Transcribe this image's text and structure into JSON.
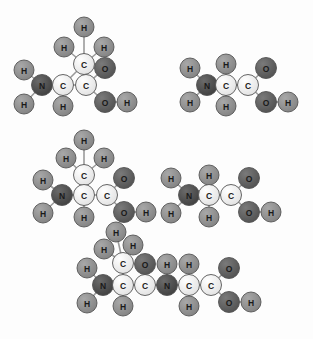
{
  "figure": {
    "width": 313,
    "height": 339,
    "background_color": "#fdfdfd"
  },
  "element_colors": {
    "C": "#ededed",
    "N": "#4d4d4d",
    "O": "#5e5e5e",
    "H": "#8f8f8f",
    "outline": "#555555",
    "bond": "#9a9a9a"
  },
  "legend_elements": [
    {
      "symbol": "C",
      "name": "carbon",
      "color": "#ededed"
    },
    {
      "symbol": "N",
      "name": "nitrogen",
      "color": "#4d4d4d"
    },
    {
      "symbol": "O",
      "name": "oxygen",
      "color": "#5e5e5e"
    },
    {
      "symbol": "H",
      "name": "hydrogen",
      "color": "#8f8f8f"
    }
  ],
  "molecules": [
    {
      "id": "alanine-top-left",
      "name": "alanine",
      "position": "top-left",
      "atoms": [
        {
          "id": "a1",
          "symbol": "H",
          "x": 84,
          "y": 27
        },
        {
          "id": "a2",
          "symbol": "H",
          "x": 64,
          "y": 47
        },
        {
          "id": "a3",
          "symbol": "H",
          "x": 104,
          "y": 47
        },
        {
          "id": "a4",
          "symbol": "C",
          "x": 84,
          "y": 64
        },
        {
          "id": "a5",
          "symbol": "H",
          "x": 24,
          "y": 70
        },
        {
          "id": "a6",
          "symbol": "N",
          "x": 42,
          "y": 85
        },
        {
          "id": "a7",
          "symbol": "H",
          "x": 24,
          "y": 104
        },
        {
          "id": "a8",
          "symbol": "C",
          "x": 63,
          "y": 85
        },
        {
          "id": "a9",
          "symbol": "H",
          "x": 63,
          "y": 106
        },
        {
          "id": "a10",
          "symbol": "C",
          "x": 86,
          "y": 85
        },
        {
          "id": "a11",
          "symbol": "O",
          "x": 105,
          "y": 68
        },
        {
          "id": "a12",
          "symbol": "O",
          "x": 105,
          "y": 102
        },
        {
          "id": "a13",
          "symbol": "H",
          "x": 127,
          "y": 102
        }
      ],
      "bonds": [
        [
          "a1",
          "a4"
        ],
        [
          "a2",
          "a4"
        ],
        [
          "a3",
          "a4"
        ],
        [
          "a4",
          "a8"
        ],
        [
          "a5",
          "a6"
        ],
        [
          "a6",
          "a7"
        ],
        [
          "a6",
          "a8"
        ],
        [
          "a8",
          "a9"
        ],
        [
          "a8",
          "a10"
        ],
        [
          "a10",
          "a11"
        ],
        [
          "a10",
          "a12"
        ],
        [
          "a12",
          "a13"
        ]
      ]
    },
    {
      "id": "glycine-top-right",
      "name": "glycine",
      "position": "top-right",
      "atoms": [
        {
          "id": "b1",
          "symbol": "H",
          "x": 190,
          "y": 68
        },
        {
          "id": "b2",
          "symbol": "N",
          "x": 207,
          "y": 85
        },
        {
          "id": "b3",
          "symbol": "H",
          "x": 190,
          "y": 102
        },
        {
          "id": "b4",
          "symbol": "H",
          "x": 226,
          "y": 64
        },
        {
          "id": "b5",
          "symbol": "C",
          "x": 226,
          "y": 85
        },
        {
          "id": "b6",
          "symbol": "H",
          "x": 226,
          "y": 106
        },
        {
          "id": "b7",
          "symbol": "C",
          "x": 248,
          "y": 85
        },
        {
          "id": "b8",
          "symbol": "O",
          "x": 266,
          "y": 68
        },
        {
          "id": "b9",
          "symbol": "O",
          "x": 266,
          "y": 102
        },
        {
          "id": "b10",
          "symbol": "H",
          "x": 288,
          "y": 102
        }
      ],
      "bonds": [
        [
          "b1",
          "b2"
        ],
        [
          "b2",
          "b3"
        ],
        [
          "b2",
          "b5"
        ],
        [
          "b4",
          "b5"
        ],
        [
          "b5",
          "b6"
        ],
        [
          "b5",
          "b7"
        ],
        [
          "b7",
          "b8"
        ],
        [
          "b7",
          "b9"
        ],
        [
          "b9",
          "b10"
        ]
      ]
    },
    {
      "id": "alanine-middle-left",
      "name": "alanine",
      "position": "middle-left",
      "atoms": [
        {
          "id": "c1",
          "symbol": "H",
          "x": 84,
          "y": 140
        },
        {
          "id": "c2",
          "symbol": "H",
          "x": 66,
          "y": 158
        },
        {
          "id": "c3",
          "symbol": "H",
          "x": 104,
          "y": 158
        },
        {
          "id": "c4",
          "symbol": "C",
          "x": 84,
          "y": 175
        },
        {
          "id": "c5",
          "symbol": "H",
          "x": 43,
          "y": 180
        },
        {
          "id": "c6",
          "symbol": "N",
          "x": 62,
          "y": 195
        },
        {
          "id": "c7",
          "symbol": "H",
          "x": 43,
          "y": 213
        },
        {
          "id": "c8",
          "symbol": "C",
          "x": 84,
          "y": 195
        },
        {
          "id": "c9",
          "symbol": "H",
          "x": 84,
          "y": 217
        },
        {
          "id": "c10",
          "symbol": "C",
          "x": 107,
          "y": 195
        },
        {
          "id": "c11",
          "symbol": "O",
          "x": 124,
          "y": 178
        },
        {
          "id": "c12",
          "symbol": "O",
          "x": 124,
          "y": 212
        },
        {
          "id": "c13",
          "symbol": "H",
          "x": 146,
          "y": 212
        }
      ],
      "bonds": [
        [
          "c1",
          "c4"
        ],
        [
          "c2",
          "c4"
        ],
        [
          "c3",
          "c4"
        ],
        [
          "c4",
          "c8"
        ],
        [
          "c5",
          "c6"
        ],
        [
          "c6",
          "c7"
        ],
        [
          "c6",
          "c8"
        ],
        [
          "c8",
          "c9"
        ],
        [
          "c8",
          "c10"
        ],
        [
          "c10",
          "c11"
        ],
        [
          "c10",
          "c12"
        ],
        [
          "c12",
          "c13"
        ]
      ]
    },
    {
      "id": "glycine-middle-right",
      "name": "glycine",
      "position": "middle-right",
      "atoms": [
        {
          "id": "d1",
          "symbol": "H",
          "x": 171,
          "y": 178
        },
        {
          "id": "d2",
          "symbol": "N",
          "x": 189,
          "y": 195
        },
        {
          "id": "d3",
          "symbol": "H",
          "x": 171,
          "y": 213
        },
        {
          "id": "d4",
          "symbol": "H",
          "x": 209,
          "y": 175
        },
        {
          "id": "d5",
          "symbol": "C",
          "x": 209,
          "y": 195
        },
        {
          "id": "d6",
          "symbol": "H",
          "x": 209,
          "y": 217
        },
        {
          "id": "d7",
          "symbol": "C",
          "x": 231,
          "y": 195
        },
        {
          "id": "d8",
          "symbol": "O",
          "x": 249,
          "y": 178
        },
        {
          "id": "d9",
          "symbol": "O",
          "x": 249,
          "y": 212
        },
        {
          "id": "d10",
          "symbol": "H",
          "x": 271,
          "y": 212
        }
      ],
      "bonds": [
        [
          "d1",
          "d2"
        ],
        [
          "d2",
          "d3"
        ],
        [
          "d2",
          "d5"
        ],
        [
          "d4",
          "d5"
        ],
        [
          "d5",
          "d6"
        ],
        [
          "d5",
          "d7"
        ],
        [
          "d7",
          "d8"
        ],
        [
          "d7",
          "d9"
        ],
        [
          "d9",
          "d10"
        ]
      ]
    },
    {
      "id": "alanylglycine-bottom",
      "name": "alanylglycine dipeptide",
      "position": "bottom",
      "atoms": [
        {
          "id": "e1",
          "symbol": "H",
          "x": 116,
          "y": 232
        },
        {
          "id": "e2",
          "symbol": "H",
          "x": 104,
          "y": 249
        },
        {
          "id": "e3",
          "symbol": "H",
          "x": 133,
          "y": 245
        },
        {
          "id": "e4",
          "symbol": "C",
          "x": 123,
          "y": 263
        },
        {
          "id": "e5",
          "symbol": "H",
          "x": 87,
          "y": 268
        },
        {
          "id": "e6",
          "symbol": "N",
          "x": 103,
          "y": 285
        },
        {
          "id": "e7",
          "symbol": "H",
          "x": 87,
          "y": 303
        },
        {
          "id": "e8",
          "symbol": "C",
          "x": 123,
          "y": 285
        },
        {
          "id": "e9",
          "symbol": "H",
          "x": 123,
          "y": 306
        },
        {
          "id": "e10",
          "symbol": "C",
          "x": 145,
          "y": 285
        },
        {
          "id": "e11",
          "symbol": "O",
          "x": 145,
          "y": 264
        },
        {
          "id": "e12",
          "symbol": "N",
          "x": 167,
          "y": 285
        },
        {
          "id": "e13",
          "symbol": "H",
          "x": 167,
          "y": 264
        },
        {
          "id": "e14",
          "symbol": "C",
          "x": 189,
          "y": 285
        },
        {
          "id": "e15",
          "symbol": "H",
          "x": 189,
          "y": 264
        },
        {
          "id": "e16",
          "symbol": "H",
          "x": 189,
          "y": 306
        },
        {
          "id": "e17",
          "symbol": "C",
          "x": 211,
          "y": 285
        },
        {
          "id": "e18",
          "symbol": "O",
          "x": 229,
          "y": 268
        },
        {
          "id": "e19",
          "symbol": "O",
          "x": 229,
          "y": 302
        },
        {
          "id": "e20",
          "symbol": "H",
          "x": 251,
          "y": 302
        }
      ],
      "bonds": [
        [
          "e1",
          "e4"
        ],
        [
          "e2",
          "e4"
        ],
        [
          "e3",
          "e4"
        ],
        [
          "e4",
          "e8"
        ],
        [
          "e5",
          "e6"
        ],
        [
          "e6",
          "e7"
        ],
        [
          "e6",
          "e8"
        ],
        [
          "e8",
          "e9"
        ],
        [
          "e8",
          "e10"
        ],
        [
          "e10",
          "e11"
        ],
        [
          "e10",
          "e12"
        ],
        [
          "e12",
          "e13"
        ],
        [
          "e12",
          "e14"
        ],
        [
          "e14",
          "e15"
        ],
        [
          "e14",
          "e16"
        ],
        [
          "e14",
          "e17"
        ],
        [
          "e17",
          "e18"
        ],
        [
          "e17",
          "e19"
        ],
        [
          "e19",
          "e20"
        ]
      ]
    }
  ]
}
